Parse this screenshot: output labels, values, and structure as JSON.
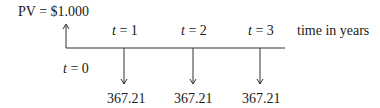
{
  "diagram": {
    "present_value_label": "PV = $1.000",
    "time_axis_label": "time in years",
    "origin": {
      "var": "t",
      "eq": " = 0"
    },
    "periods": [
      {
        "var": "t",
        "eq": " = 1",
        "cash_flow": "367.21"
      },
      {
        "var": "t",
        "eq": " = 2",
        "cash_flow": "367.21"
      },
      {
        "var": "t",
        "eq": " = 3",
        "cash_flow": "367.21"
      }
    ],
    "colors": {
      "line": "#333333",
      "text": "#1a1a1a"
    }
  }
}
